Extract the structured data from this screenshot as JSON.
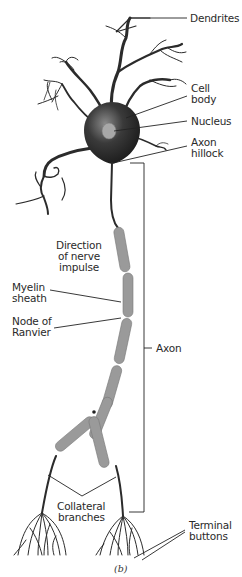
{
  "figure": {
    "caption": "(b)"
  },
  "labels": {
    "dendrites": "Dendrites",
    "cell_body_1": "Cell",
    "cell_body_2": "body",
    "nucleus": "Nucleus",
    "axon_hillock_1": "Axon",
    "axon_hillock_2": "hillock",
    "direction_1": "Direction",
    "direction_2": "of nerve",
    "direction_3": "impulse",
    "myelin_1": "Myelin",
    "myelin_2": "sheath",
    "node_1": "Node of",
    "node_2": "Ranvier",
    "axon": "Axon",
    "collateral_1": "Collateral",
    "collateral_2": "branches",
    "terminal_1": "Terminal",
    "terminal_2": "buttons"
  },
  "colors": {
    "ink": "#2b2b2b",
    "myelin": "#9a9a9a",
    "nucleus": "#a8a8a8",
    "background": "#ffffff"
  }
}
